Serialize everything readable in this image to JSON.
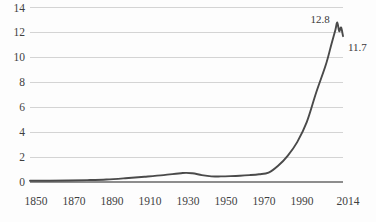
{
  "chart_data": {
    "type": "line",
    "title": "",
    "subtitle": "",
    "xlabel": "",
    "ylabel": "",
    "xlim": [
      1850,
      2014
    ],
    "ylim": [
      0,
      14
    ],
    "grid": true,
    "legend": null,
    "y_ticks": [
      "0",
      "2",
      "4",
      "6",
      "8",
      "10",
      "12",
      "14"
    ],
    "y_tick_values": [
      0,
      2,
      4,
      6,
      8,
      10,
      12,
      14
    ],
    "x_ticks": [
      "1850",
      "1870",
      "1890",
      "1910",
      "1930",
      "1950",
      "1970",
      "1990",
      "2014"
    ],
    "x_tick_values": [
      1850,
      1870,
      1890,
      1910,
      1930,
      1950,
      1970,
      1990,
      2014
    ],
    "series": [
      {
        "name": "series-1",
        "color": "#4a4a4a",
        "x": [
          1850,
          1860,
          1870,
          1880,
          1890,
          1900,
          1910,
          1920,
          1930,
          1935,
          1940,
          1945,
          1950,
          1955,
          1960,
          1965,
          1970,
          1975,
          1980,
          1985,
          1990,
          1995,
          2000,
          2005,
          2008,
          2010,
          2011,
          2012,
          2013,
          2014
        ],
        "y": [
          0.1,
          0.1,
          0.12,
          0.15,
          0.2,
          0.3,
          0.42,
          0.55,
          0.72,
          0.7,
          0.55,
          0.45,
          0.45,
          0.47,
          0.5,
          0.55,
          0.62,
          0.75,
          1.3,
          2.1,
          3.2,
          4.8,
          7.2,
          9.4,
          11.1,
          12.2,
          12.8,
          12.1,
          12.4,
          11.7
        ]
      }
    ],
    "annotations": [
      {
        "name": "peak-label",
        "text": "12.8",
        "value": 12.8,
        "x_px": 331,
        "y_px": 23
      },
      {
        "name": "end-label",
        "text": "11.7",
        "value": 11.7,
        "x_px": 349,
        "y_px": 49
      }
    ]
  },
  "axes": {
    "y_labels": [
      {
        "text": "14",
        "y_px": 10
      },
      {
        "text": "12",
        "y_px": 35.3
      },
      {
        "text": "10",
        "y_px": 60.6
      },
      {
        "text": "8",
        "y_px": 85.9
      },
      {
        "text": "6",
        "y_px": 111.1
      },
      {
        "text": "4",
        "y_px": 136.4
      },
      {
        "text": "2",
        "y_px": 161.7
      },
      {
        "text": "0",
        "y_px": 187.0
      }
    ],
    "x_labels": [
      {
        "text": "1850",
        "x_px": 36
      },
      {
        "text": "1870",
        "x_px": 74
      },
      {
        "text": "1890",
        "x_px": 112
      },
      {
        "text": "1910",
        "x_px": 150
      },
      {
        "text": "1930",
        "x_px": 188
      },
      {
        "text": "1950",
        "x_px": 226
      },
      {
        "text": "1970",
        "x_px": 264
      },
      {
        "text": "1990",
        "x_px": 302
      },
      {
        "text": "2014",
        "x_px": 348
      }
    ]
  }
}
